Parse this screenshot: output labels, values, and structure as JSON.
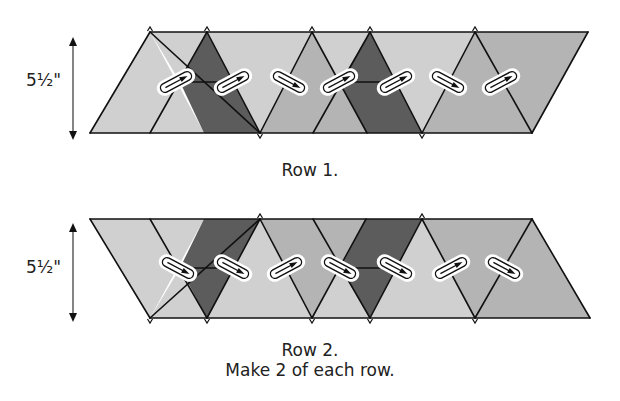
{
  "colors": {
    "light": "#d0d0d0",
    "medium": "#b4b4b4",
    "dark": "#5c5c5c",
    "stroke": "#111111",
    "marker_fill": "#ffffff"
  },
  "rows": [
    {
      "id": "row-1",
      "caption": "Row 1.",
      "dimension_label": "5½\"",
      "top_y": 32,
      "bottom_y": 133,
      "mid_y": 82,
      "pieces": [
        {
          "shade": "light",
          "points": [
            [
              90,
              133
            ],
            [
              150,
              32
            ],
            [
              204,
              133
            ]
          ]
        },
        {
          "shade": "light",
          "points": [
            [
              150,
              32
            ],
            [
              207,
              32
            ],
            [
              180,
              82
            ]
          ]
        },
        {
          "shade": "dark",
          "points": [
            [
              207,
              32
            ],
            [
              180,
              82
            ],
            [
              234,
              82
            ]
          ]
        },
        {
          "shade": "dark",
          "points": [
            [
              180,
              82
            ],
            [
              234,
              82
            ],
            [
              260,
              133
            ],
            [
              204,
              133
            ]
          ]
        },
        {
          "shade": "light",
          "points": [
            [
              207,
              32
            ],
            [
              312,
              32
            ],
            [
              260,
              133
            ]
          ]
        },
        {
          "shade": "medium",
          "points": [
            [
              260,
              133
            ],
            [
              312,
              32
            ],
            [
              367,
              133
            ]
          ]
        },
        {
          "shade": "light",
          "points": [
            [
              312,
              32
            ],
            [
              370,
              32
            ],
            [
              340,
              82
            ]
          ]
        },
        {
          "shade": "dark",
          "points": [
            [
              370,
              32
            ],
            [
              340,
              82
            ],
            [
              396,
              82
            ]
          ]
        },
        {
          "shade": "dark",
          "points": [
            [
              340,
              82
            ],
            [
              396,
              82
            ],
            [
              422,
              133
            ],
            [
              367,
              133
            ]
          ]
        },
        {
          "shade": "light",
          "points": [
            [
              370,
              32
            ],
            [
              475,
              32
            ],
            [
              422,
              133
            ]
          ]
        },
        {
          "shade": "medium",
          "points": [
            [
              422,
              133
            ],
            [
              475,
              32
            ],
            [
              532,
              133
            ]
          ]
        },
        {
          "shade": "medium",
          "points": [
            [
              475,
              32
            ],
            [
              588,
              32
            ],
            [
              532,
              133
            ]
          ]
        }
      ],
      "lines": [
        [
          [
            90,
            133
          ],
          [
            150,
            32
          ]
        ],
        [
          [
            150,
            32
          ],
          [
            260,
            133
          ]
        ],
        [
          [
            207,
            32
          ],
          [
            150,
            133
          ]
        ],
        [
          [
            180,
            82
          ],
          [
            234,
            82
          ]
        ],
        [
          [
            207,
            32
          ],
          [
            260,
            133
          ]
        ],
        [
          [
            312,
            32
          ],
          [
            260,
            133
          ]
        ],
        [
          [
            312,
            32
          ],
          [
            367,
            133
          ]
        ],
        [
          [
            370,
            32
          ],
          [
            313,
            133
          ]
        ],
        [
          [
            340,
            82
          ],
          [
            396,
            82
          ]
        ],
        [
          [
            370,
            32
          ],
          [
            422,
            133
          ]
        ],
        [
          [
            475,
            32
          ],
          [
            422,
            133
          ]
        ],
        [
          [
            475,
            32
          ],
          [
            532,
            133
          ]
        ],
        [
          [
            588,
            32
          ],
          [
            532,
            133
          ]
        ],
        [
          [
            90,
            133
          ],
          [
            532,
            133
          ]
        ],
        [
          [
            150,
            32
          ],
          [
            588,
            32
          ]
        ]
      ],
      "ticks_top": [
        150,
        207,
        312,
        370,
        475
      ],
      "ticks_bottom": [
        260,
        422
      ],
      "markers": [
        {
          "x": 176,
          "y": 82,
          "dir": "up-right"
        },
        {
          "x": 233,
          "y": 82,
          "dir": "up-right"
        },
        {
          "x": 289,
          "y": 82,
          "dir": "down-right"
        },
        {
          "x": 339,
          "y": 82,
          "dir": "up-right"
        },
        {
          "x": 396,
          "y": 82,
          "dir": "up-right"
        },
        {
          "x": 448,
          "y": 82,
          "dir": "down-right"
        },
        {
          "x": 501,
          "y": 82,
          "dir": "up-right"
        }
      ]
    },
    {
      "id": "row-2",
      "caption": "Row 2.",
      "dimension_label": "5½\"",
      "top_y": 219,
      "bottom_y": 318,
      "mid_y": 268,
      "pieces": [
        {
          "shade": "light",
          "points": [
            [
              90,
              219
            ],
            [
              150,
              318
            ],
            [
              204,
              219
            ]
          ]
        },
        {
          "shade": "light",
          "points": [
            [
              150,
              318
            ],
            [
              207,
              318
            ],
            [
              180,
              268
            ]
          ]
        },
        {
          "shade": "dark",
          "points": [
            [
              207,
              318
            ],
            [
              180,
              268
            ],
            [
              234,
              268
            ]
          ]
        },
        {
          "shade": "dark",
          "points": [
            [
              180,
              268
            ],
            [
              234,
              268
            ],
            [
              260,
              219
            ],
            [
              204,
              219
            ]
          ]
        },
        {
          "shade": "light",
          "points": [
            [
              207,
              318
            ],
            [
              312,
              318
            ],
            [
              260,
              219
            ]
          ]
        },
        {
          "shade": "medium",
          "points": [
            [
              260,
              219
            ],
            [
              312,
              318
            ],
            [
              366,
              219
            ]
          ]
        },
        {
          "shade": "light",
          "points": [
            [
              312,
              318
            ],
            [
              370,
              318
            ],
            [
              340,
              268
            ]
          ]
        },
        {
          "shade": "dark",
          "points": [
            [
              370,
              318
            ],
            [
              340,
              268
            ],
            [
              396,
              268
            ]
          ]
        },
        {
          "shade": "dark",
          "points": [
            [
              340,
              268
            ],
            [
              396,
              268
            ],
            [
              422,
              219
            ],
            [
              366,
              219
            ]
          ]
        },
        {
          "shade": "light",
          "points": [
            [
              370,
              318
            ],
            [
              475,
              318
            ],
            [
              422,
              219
            ]
          ]
        },
        {
          "shade": "medium",
          "points": [
            [
              422,
              219
            ],
            [
              475,
              318
            ],
            [
              532,
              219
            ]
          ]
        },
        {
          "shade": "medium",
          "points": [
            [
              475,
              318
            ],
            [
              590,
              318
            ],
            [
              532,
              219
            ]
          ]
        }
      ],
      "lines": [
        [
          [
            90,
            219
          ],
          [
            150,
            318
          ]
        ],
        [
          [
            150,
            318
          ],
          [
            260,
            219
          ]
        ],
        [
          [
            207,
            318
          ],
          [
            150,
            219
          ]
        ],
        [
          [
            180,
            268
          ],
          [
            234,
            268
          ]
        ],
        [
          [
            207,
            318
          ],
          [
            260,
            219
          ]
        ],
        [
          [
            312,
            318
          ],
          [
            260,
            219
          ]
        ],
        [
          [
            312,
            318
          ],
          [
            366,
            219
          ]
        ],
        [
          [
            370,
            318
          ],
          [
            313,
            219
          ]
        ],
        [
          [
            340,
            268
          ],
          [
            396,
            268
          ]
        ],
        [
          [
            370,
            318
          ],
          [
            422,
            219
          ]
        ],
        [
          [
            475,
            318
          ],
          [
            422,
            219
          ]
        ],
        [
          [
            475,
            318
          ],
          [
            532,
            219
          ]
        ],
        [
          [
            590,
            318
          ],
          [
            532,
            219
          ]
        ],
        [
          [
            90,
            219
          ],
          [
            532,
            219
          ]
        ],
        [
          [
            150,
            318
          ],
          [
            590,
            318
          ]
        ]
      ],
      "ticks_top": [
        260,
        422
      ],
      "ticks_bottom": [
        150,
        207,
        312,
        370,
        475
      ],
      "markers": [
        {
          "x": 178,
          "y": 268,
          "dir": "down-right"
        },
        {
          "x": 233,
          "y": 268,
          "dir": "down-right"
        },
        {
          "x": 286,
          "y": 268,
          "dir": "up-right"
        },
        {
          "x": 340,
          "y": 268,
          "dir": "down-right"
        },
        {
          "x": 396,
          "y": 268,
          "dir": "down-right"
        },
        {
          "x": 451,
          "y": 268,
          "dir": "up-right"
        },
        {
          "x": 504,
          "y": 268,
          "dir": "down-right"
        }
      ]
    }
  ],
  "instructions": "Make 2 of each row."
}
